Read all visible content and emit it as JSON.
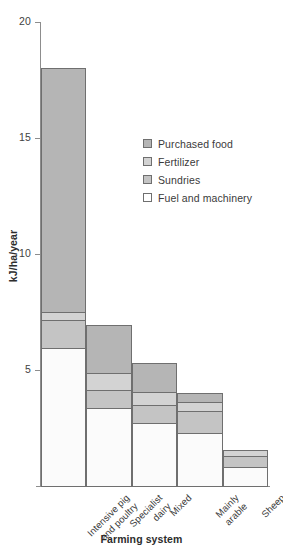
{
  "chart_data": {
    "type": "bar",
    "subtype": "stacked-bar",
    "title": "",
    "xlabel": "Farming system",
    "ylabel": "kJ/ha/year",
    "ylim": [
      0,
      20
    ],
    "yticks": [
      5,
      10,
      15,
      20
    ],
    "ytick_labels": [
      "5",
      "10",
      "15",
      "20"
    ],
    "grid": false,
    "legend_position": "inside-upper-right",
    "categories": [
      "Intensive pig and poultry",
      "Specialist dairy",
      "Mixed",
      "Mainly arable",
      "Sheep"
    ],
    "category_lines": [
      [
        "Intensive pig",
        "and poultry"
      ],
      [
        "Specialist",
        "dairy"
      ],
      [
        "Mixed"
      ],
      [
        "Mainly",
        "arable"
      ],
      [
        "Sheep"
      ]
    ],
    "series": [
      {
        "name": "Fuel and machinery",
        "color": "#fbfbfb",
        "values": [
          5.95,
          3.35,
          2.7,
          2.3,
          0.8
        ]
      },
      {
        "name": "Sundries",
        "color": "#c4c4c4",
        "values": [
          1.2,
          0.8,
          0.8,
          0.95,
          0.5
        ]
      },
      {
        "name": "Fertilizer",
        "color": "#d3d3d3",
        "values": [
          0.35,
          0.7,
          0.55,
          0.35,
          0.25
        ]
      },
      {
        "name": "Purchased food",
        "color": "#b5b5b5",
        "values": [
          10.5,
          2.1,
          1.25,
          0.4,
          0.0
        ]
      }
    ],
    "totals": [
      18.0,
      6.95,
      5.3,
      4.0,
      1.55
    ],
    "legend_entries": [
      {
        "label": "Purchased food",
        "swatch": "purchased"
      },
      {
        "label": "Fertilizer",
        "swatch": "fertilizer"
      },
      {
        "label": "Sundries",
        "swatch": "sundries"
      },
      {
        "label": "Fuel and machinery",
        "swatch": "fuel"
      }
    ],
    "axis_color": "#8d8d8d",
    "bar_border_color": "#6f6f6f"
  }
}
